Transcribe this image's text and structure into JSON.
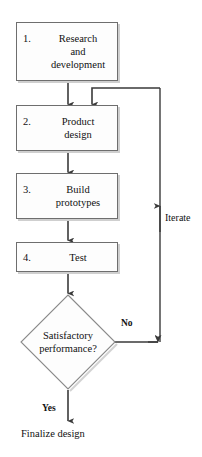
{
  "diagram": {
    "colors": {
      "box_fill": "#fdfdfd",
      "box_stroke": "#6e6e6e",
      "shadow": "#cfcfcf",
      "line": "#3a3a3a",
      "text": "#111111"
    },
    "nodes": [
      {
        "id": "research",
        "number": "1.",
        "label": "Research\nand\ndevelopment",
        "shape": "rectangle"
      },
      {
        "id": "product-design",
        "number": "2.",
        "label": "Product\ndesign",
        "shape": "rectangle"
      },
      {
        "id": "build-prototypes",
        "number": "3.",
        "label": "Build\nprototypes",
        "shape": "rectangle"
      },
      {
        "id": "test",
        "number": "4.",
        "label": "Test",
        "shape": "rectangle"
      }
    ],
    "decision": {
      "id": "satisfactory-performance",
      "line1": "Satisfactory",
      "line2": "performance?",
      "shape": "diamond"
    },
    "edge_labels": {
      "no": "No",
      "yes": "Yes",
      "iterate": "Iterate"
    },
    "terminal": {
      "label": "Finalize design"
    }
  }
}
